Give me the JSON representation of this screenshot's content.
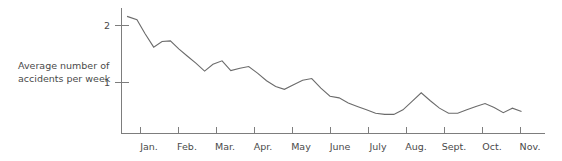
{
  "chart_data": {
    "type": "line",
    "title": "",
    "subtitle": "",
    "xlabel": "",
    "ylabel": "Average number of\naccidents per week",
    "ylabel_line1": "Average number of",
    "ylabel_line2": "accidents per week",
    "categories": [
      "Jan.",
      "Feb.",
      "Mar.",
      "Apr.",
      "May",
      "June",
      "July",
      "Aug.",
      "Sept.",
      "Oct.",
      "Nov."
    ],
    "y_tick_labels": [
      "1",
      "2"
    ],
    "y_tick_values": [
      1,
      2
    ],
    "ylim": [
      0,
      2.35
    ],
    "xlim": [
      0,
      11.1
    ],
    "grid": false,
    "legend": false,
    "legend_position": "none",
    "line_color": "#6b6b6b",
    "axis_color": "#7d7d7d",
    "text_color": "#4a4a4a",
    "background_color": "#ffffff",
    "series": [
      {
        "name": "Average number of accidents per week",
        "x": [
          0.16,
          0.42,
          0.63,
          0.86,
          1.08,
          1.3,
          1.52,
          1.75,
          1.97,
          2.2,
          2.42,
          2.66,
          2.89,
          3.13,
          3.36,
          3.6,
          3.83,
          4.07,
          4.3,
          4.54,
          4.78,
          5.02,
          5.26,
          5.5,
          5.74,
          5.98,
          6.22,
          6.46,
          6.7,
          6.94,
          7.18,
          7.42,
          7.66,
          7.9,
          8.14,
          8.38,
          8.62,
          8.86,
          9.1,
          9.34,
          9.58,
          9.82,
          10.06,
          10.3,
          10.54
        ],
        "values": [
          2.16,
          2.1,
          1.86,
          1.62,
          1.72,
          1.73,
          1.59,
          1.46,
          1.34,
          1.2,
          1.32,
          1.38,
          1.21,
          1.25,
          1.28,
          1.16,
          1.03,
          0.93,
          0.88,
          0.96,
          1.04,
          1.07,
          0.9,
          0.76,
          0.73,
          0.64,
          0.58,
          0.52,
          0.46,
          0.44,
          0.44,
          0.52,
          0.67,
          0.82,
          0.68,
          0.55,
          0.46,
          0.46,
          0.52,
          0.58,
          0.63,
          0.56,
          0.47,
          0.55,
          0.49
        ]
      }
    ],
    "annotations": []
  },
  "accessibility": {
    "figure_description": "Line chart showing average number of accidents per week declining from about 2.2 in January to about 0.4 by November, with a temporary peak in mid-July."
  }
}
